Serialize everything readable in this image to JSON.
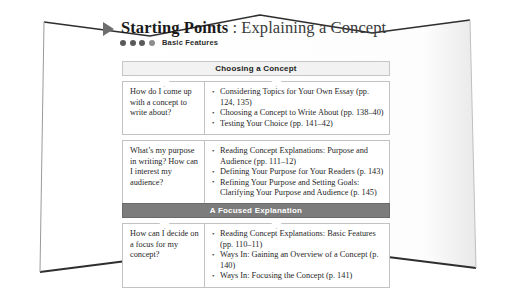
{
  "page": {
    "heading": {
      "marker_icon": "triangle-right-icon",
      "title_strong": "Starting Points",
      "title_rest": ": Explaining a Concept"
    },
    "subheading": {
      "label": "Basic Features",
      "dot_count": 4
    },
    "colors": {
      "band_light": "#f2f2f2",
      "band_dark": "#7c7c7c",
      "marker": "#6e6e6e",
      "text": "#1f1f1f",
      "border": "#c2c2c2"
    }
  },
  "sections": [
    {
      "band_label": "Choosing a Concept",
      "band_style": "light",
      "rows": [
        {
          "question": "How do I come up with a concept to write about?",
          "items": [
            "Considering Topics for Your Own Essay (pp. 124, 135)",
            "Choosing a Concept to Write About (pp. 138–40)",
            "Testing Your Choice (pp. 141–42)"
          ]
        },
        {
          "question": "What’s my purpose in writing? How can I interest my audience?",
          "items": [
            "Reading Concept Explanations: Purpose and Audience (pp. 111–12)",
            "Defining Your Purpose for Your Readers (p. 143)",
            "Refining Your Purpose and Setting Goals: Clarifying Your Purpose and Audience (p. 145)"
          ]
        }
      ]
    },
    {
      "band_label": "A Focused Explanation",
      "band_style": "dark",
      "rows": [
        {
          "question": "How can I decide on a focus for my concept?",
          "items": [
            "Reading Concept Explanations: Basic Features (pp. 110–11)",
            "Ways In: Gaining an Overview of a Concept (p. 140)",
            "Ways In: Focusing the Concept (p. 141)"
          ]
        }
      ]
    }
  ]
}
